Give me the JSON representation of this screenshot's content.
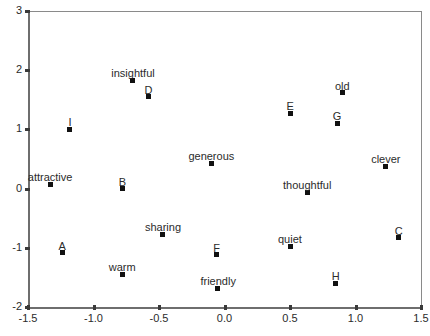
{
  "chart_data": {
    "type": "scatter",
    "title": "",
    "subtitle": "",
    "xlabel": "",
    "ylabel": "",
    "xlim": [
      -1.5,
      1.5
    ],
    "ylim": [
      -2,
      3
    ],
    "xticks": [
      "-1.5",
      "-1.0",
      "-0.5",
      "0.0",
      "0.5",
      "1.0",
      "1.5"
    ],
    "xtick_values": [
      -1.5,
      -1.0,
      -0.5,
      0.0,
      0.5,
      1.0,
      1.5
    ],
    "yticks": [
      "3",
      "2",
      "1",
      "0",
      "-1",
      "-2"
    ],
    "ytick_values": [
      3,
      2,
      1,
      0,
      -1,
      -2
    ],
    "grid": false,
    "legend": "none",
    "marker_color": "#111111",
    "axis_color": "#6e6e6e",
    "text_color": "#2b2b2b",
    "points": [
      {
        "label": "insightful",
        "x": -0.7,
        "y": 1.83,
        "label_dx": 0,
        "label_dy": -12
      },
      {
        "label": "D",
        "x": -0.58,
        "y": 1.55,
        "label_dx": 0,
        "label_dy": -12
      },
      {
        "label": "I",
        "x": -1.18,
        "y": 1.0,
        "label_dx": 0,
        "label_dy": -12
      },
      {
        "label": "old",
        "x": 0.9,
        "y": 1.62,
        "label_dx": 0,
        "label_dy": -12
      },
      {
        "label": "E",
        "x": 0.5,
        "y": 1.27,
        "label_dx": 0,
        "label_dy": -12
      },
      {
        "label": "G",
        "x": 0.86,
        "y": 1.1,
        "label_dx": 0,
        "label_dy": -12
      },
      {
        "label": "clever",
        "x": 1.23,
        "y": 0.38,
        "label_dx": 0,
        "label_dy": -12
      },
      {
        "label": "generous",
        "x": -0.1,
        "y": 0.43,
        "label_dx": 0,
        "label_dy": -12
      },
      {
        "label": "attractive",
        "x": -1.33,
        "y": 0.07,
        "label_dx": 0,
        "label_dy": -12
      },
      {
        "label": "B",
        "x": -0.78,
        "y": 0.0,
        "label_dx": 0,
        "label_dy": -12
      },
      {
        "label": "thoughtful",
        "x": 0.63,
        "y": -0.06,
        "label_dx": 0,
        "label_dy": -12
      },
      {
        "label": "sharing",
        "x": -0.47,
        "y": -0.77,
        "label_dx": 0,
        "label_dy": -12
      },
      {
        "label": "quiet",
        "x": 0.5,
        "y": -0.97,
        "label_dx": 0,
        "label_dy": -12
      },
      {
        "label": "C",
        "x": 1.33,
        "y": -0.83,
        "label_dx": 0,
        "label_dy": -12
      },
      {
        "label": "A",
        "x": -1.24,
        "y": -1.08,
        "label_dx": 0,
        "label_dy": -12
      },
      {
        "label": "F",
        "x": -0.06,
        "y": -1.12,
        "label_dx": 0,
        "label_dy": -12
      },
      {
        "label": "warm",
        "x": -0.78,
        "y": -1.45,
        "label_dx": 0,
        "label_dy": -12
      },
      {
        "label": "H",
        "x": 0.85,
        "y": -1.6,
        "label_dx": 0,
        "label_dy": -12
      },
      {
        "label": "friendly",
        "x": -0.05,
        "y": -1.68,
        "label_dx": 0,
        "label_dy": -12
      }
    ]
  }
}
